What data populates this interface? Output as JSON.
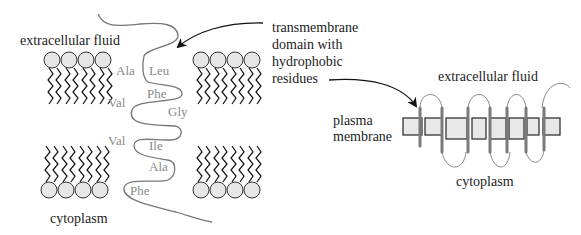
{
  "left_panel": {
    "top_label": "extracellular fluid",
    "bottom_label": "cytoplasm",
    "residues": [
      {
        "name": "Ala",
        "x": 116,
        "y": 75
      },
      {
        "name": "Leu",
        "x": 149,
        "y": 75
      },
      {
        "name": "Phe",
        "x": 147,
        "y": 98
      },
      {
        "name": "Val",
        "x": 108,
        "y": 107
      },
      {
        "name": "Gly",
        "x": 168,
        "y": 116
      },
      {
        "name": "Val",
        "x": 108,
        "y": 145
      },
      {
        "name": "Ile",
        "x": 149,
        "y": 150
      },
      {
        "name": "Ala",
        "x": 149,
        "y": 171
      },
      {
        "name": "Phe",
        "x": 130,
        "y": 195
      }
    ]
  },
  "callout": {
    "lines": [
      "transmembrane",
      "domain with",
      "hydrophobic",
      "residues"
    ]
  },
  "right_panel": {
    "top_label": "extracellular fluid",
    "side_label_lines": [
      "plasma",
      "membrane"
    ],
    "bottom_label": "cytoplasm"
  },
  "colors": {
    "text": "#222222",
    "residue_text": "#8a8a8a",
    "chain": "#777777",
    "lipid_head_fill": "#e6e6e6",
    "helix": "#7a7a7a",
    "box_fill": "#e8e8e8"
  }
}
